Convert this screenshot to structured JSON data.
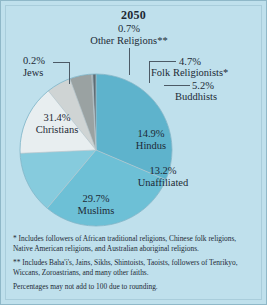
{
  "chart_data": {
    "type": "pie",
    "title": "2050",
    "xlabel": "",
    "ylabel": "",
    "legend_position": "callout-labels",
    "grid": false,
    "categories": [
      "Christians",
      "Muslims",
      "Unaffiliated",
      "Hindus",
      "Buddhists",
      "Folk Religionists*",
      "Jews",
      "Other Religions**"
    ],
    "values": [
      31.4,
      29.7,
      13.2,
      14.9,
      5.2,
      4.7,
      0.2,
      0.7
    ],
    "value_labels": [
      "31.4%",
      "29.7%",
      "13.2%",
      "14.9%",
      "5.2%",
      "4.7%",
      "0.2%",
      "0.7%"
    ],
    "colors": [
      "#5eb3cc",
      "#6dc0d6",
      "#86cbdd",
      "#e8eef0",
      "#cfd4d4",
      "#9aa2a2",
      "#7d8c93",
      "#5d6c74"
    ],
    "annotations": [
      "* Includes followers of African traditional religions, Chinese folk religions, Native American religions, and Australian aboriginal religions.",
      "** Includes Baha'i's, Jains, Sikhs, Shintoists, Taoists, followers of Tenrikyo, Wiccans, Zoroastrians, and many other faiths.",
      "Percentages may not add to 100 due to rounding."
    ]
  },
  "labels": {
    "other_religions": {
      "pct": "0.7%",
      "name": "Other Religions**"
    },
    "jews": {
      "pct": "0.2%",
      "name": "Jews"
    },
    "folk": {
      "pct": "4.7%",
      "name": "Folk Religionists*"
    },
    "buddhists": {
      "pct": "5.2%",
      "name": "Buddhists"
    },
    "hindus": {
      "pct": "14.9%",
      "name": "Hindus"
    },
    "unaffiliated": {
      "pct": "13.2%",
      "name": "Unaffiliated"
    },
    "muslims": {
      "pct": "29.7%",
      "name": "Muslims"
    },
    "christians": {
      "pct": "31.4%",
      "name": "Christians"
    }
  },
  "footnotes": {
    "note_single_star": "* Includes followers of African traditional religions, Chinese folk religions, Native American religions, and Australian aboriginal religions.",
    "note_double_star": "** Includes Baha'i's, Jains, Sikhs, Shintoists, Taoists, followers of Tenrikyo, Wiccans, Zoroastrians, and many other faiths.",
    "note_rounding": "Percentages may not add to 100 due to rounding."
  }
}
